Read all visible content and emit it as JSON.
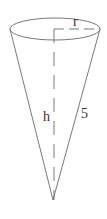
{
  "figure": {
    "type": "cone",
    "labels": {
      "radius": "r",
      "height": "h",
      "slant": "5"
    },
    "colors": {
      "line": "#7a7a7a",
      "text": "#333333"
    }
  }
}
